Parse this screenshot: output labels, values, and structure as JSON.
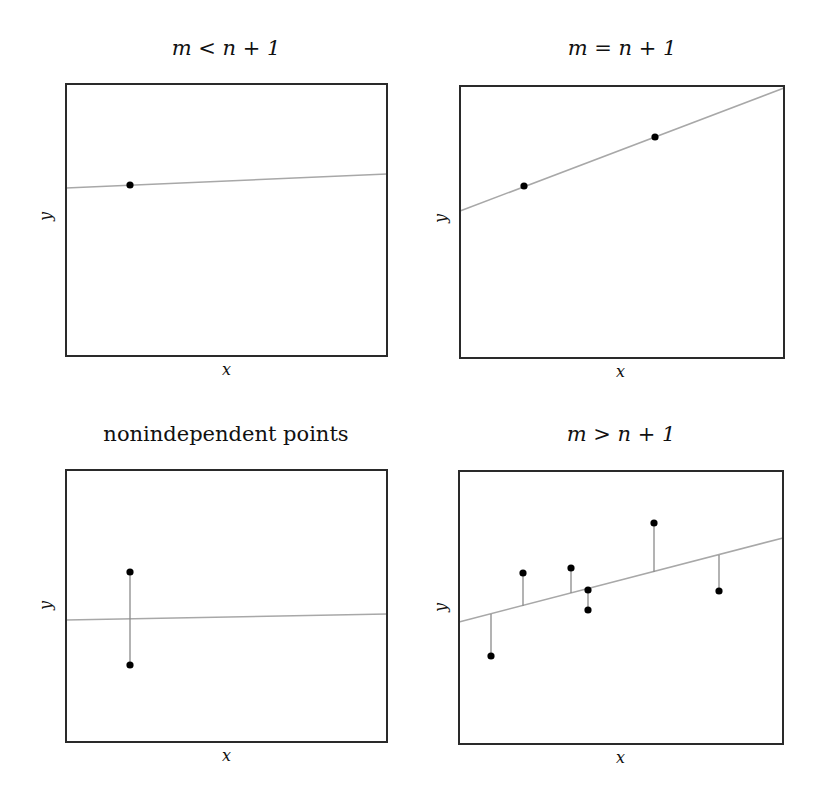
{
  "colors": {
    "frame": "#2a2a2a",
    "fit_line": "#a8a8a8",
    "residual": "#8a8a8a",
    "point": "#000000"
  },
  "panels": [
    {
      "title": "m < n + 1",
      "xlabel": "x",
      "ylabel": "y",
      "frame": [
        66,
        84,
        387,
        356
      ],
      "line": [
        66,
        188,
        387,
        174
      ],
      "points": [
        [
          130,
          185
        ]
      ],
      "residuals": []
    },
    {
      "title": "m = n + 1",
      "xlabel": "x",
      "ylabel": "y",
      "frame": [
        460,
        86,
        784,
        358
      ],
      "line": [
        460,
        211,
        784,
        88
      ],
      "points": [
        [
          524,
          186
        ],
        [
          655,
          137
        ]
      ],
      "residuals": []
    },
    {
      "title": "nonindependent points",
      "xlabel": "x",
      "ylabel": "y",
      "frame": [
        66,
        470,
        387,
        742
      ],
      "line": [
        66,
        620,
        387,
        614
      ],
      "points": [
        [
          130,
          572
        ],
        [
          130,
          665
        ]
      ],
      "residuals": [
        [
          130,
          572,
          130,
          665
        ]
      ]
    },
    {
      "title": "m > n + 1",
      "xlabel": "x",
      "ylabel": "y",
      "frame": [
        459,
        471,
        783,
        744
      ],
      "line": [
        459,
        622,
        783,
        538
      ],
      "points": [
        [
          491,
          656
        ],
        [
          523,
          573
        ],
        [
          571,
          568
        ],
        [
          588,
          590
        ],
        [
          588,
          610
        ],
        [
          654,
          523
        ],
        [
          719,
          591
        ]
      ],
      "residuals": [
        [
          491,
          656,
          491,
          614
        ],
        [
          523,
          573,
          523,
          606
        ],
        [
          571,
          568,
          571,
          593
        ],
        [
          588,
          590,
          588,
          610
        ],
        [
          654,
          523,
          654,
          572
        ],
        [
          719,
          591,
          719,
          555
        ]
      ]
    }
  ]
}
